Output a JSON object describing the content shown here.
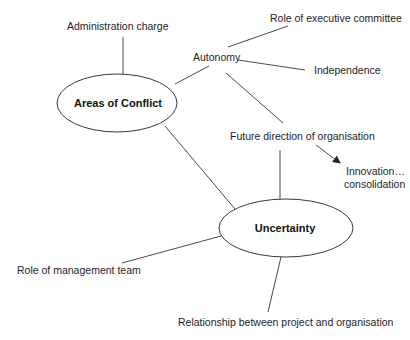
{
  "diagram": {
    "type": "mind-map",
    "nodes": {
      "areas_of_conflict": "Areas of Conflict",
      "uncertainty": "Uncertainty"
    },
    "labels": {
      "administration_charge": "Administration charge",
      "autonomy": "Autonomy",
      "role_of_executive_committee": "Role of executive committee",
      "independence": "Independence",
      "future_direction": "Future direction of organisation",
      "innovation_line1": "Innovation…",
      "innovation_line2": "consolidation",
      "role_of_management_team": "Role of management team",
      "relationship": "Relationship between project and organisation"
    },
    "edges": [
      {
        "from": "Areas of Conflict",
        "to": "Administration charge"
      },
      {
        "from": "Areas of Conflict",
        "to": "Autonomy"
      },
      {
        "from": "Areas of Conflict",
        "to": "Uncertainty"
      },
      {
        "from": "Autonomy",
        "to": "Role of executive committee"
      },
      {
        "from": "Autonomy",
        "to": "Independence"
      },
      {
        "from": "Autonomy",
        "to": "Future direction of organisation"
      },
      {
        "from": "Future direction of organisation",
        "to": "Innovation… consolidation",
        "arrow": true
      },
      {
        "from": "Future direction of organisation",
        "to": "Uncertainty"
      },
      {
        "from": "Uncertainty",
        "to": "Role of management team"
      },
      {
        "from": "Uncertainty",
        "to": "Relationship between project and organisation"
      }
    ]
  }
}
